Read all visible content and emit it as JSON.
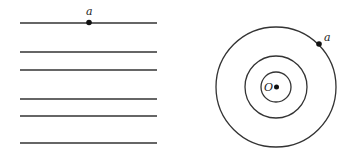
{
  "left_figure": {
    "description": "parallel lines",
    "lines_y": [
      23,
      52,
      70,
      99,
      116,
      143
    ],
    "x_start": 20,
    "x_end": 157,
    "point": {
      "label": "a",
      "x": 89,
      "y": 22
    }
  },
  "right_figure": {
    "description": "concentric circles",
    "center": {
      "label": "O",
      "x": 276,
      "y": 87
    },
    "radii": [
      15,
      31,
      60
    ],
    "point": {
      "label": "a",
      "x": 319,
      "y": 44
    }
  },
  "colors": {
    "stroke": "#333333",
    "background": "#ffffff"
  }
}
